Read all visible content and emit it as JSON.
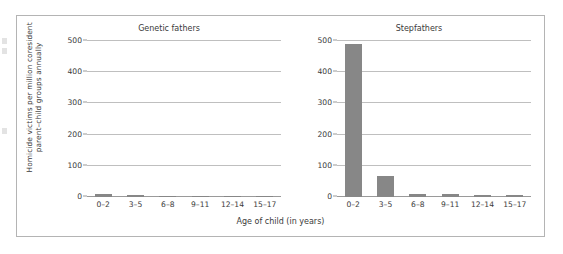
{
  "chart_data": {
    "type": "bar",
    "title": "",
    "xlabel": "Age of child (in years)",
    "ylabel": "Homicide victims per million coresident\nparent–child groups annually",
    "categories": [
      "0–2",
      "3–5",
      "6–8",
      "9–11",
      "12–14",
      "15–17"
    ],
    "ylim": [
      0,
      500
    ],
    "yticks": [
      0,
      100,
      200,
      300,
      400,
      500
    ],
    "ytick_labels": [
      "0",
      "100",
      "200",
      "300",
      "400",
      "500"
    ],
    "grid": "horizontal",
    "legend": "none",
    "bar_color": "#878787",
    "panels": [
      {
        "title": "Genetic fathers",
        "series": [
          {
            "name": "Genetic fathers",
            "values": [
              11,
              7,
              4,
              4,
              4,
              3
            ]
          }
        ]
      },
      {
        "title": "Stepfathers",
        "series": [
          {
            "name": "Stepfathers",
            "values": [
              490,
              68,
              9,
              10,
              7,
              6
            ]
          }
        ]
      }
    ]
  }
}
